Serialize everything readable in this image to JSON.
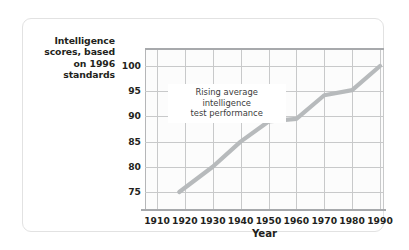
{
  "chart_data": {
    "type": "line",
    "title": "",
    "xlabel": "Year",
    "ylabel": "Intelligence scores, based on 1996 standards",
    "xlim": [
      1910,
      1995
    ],
    "ylim": [
      72,
      103
    ],
    "grid": true,
    "legend": "none",
    "xticks": [
      1910,
      1920,
      1930,
      1940,
      1950,
      1960,
      1970,
      1980,
      1990
    ],
    "yticks": [
      75,
      80,
      85,
      90,
      95,
      100
    ],
    "annotations": [
      {
        "text": "Rising average intelligence test performance",
        "line1": "Rising average intelligence",
        "line2": "test performance",
        "x": 1935,
        "y": 96
      }
    ],
    "series": [
      {
        "name": "Intelligence scores",
        "color": "#b7babc",
        "x": [
          1918,
          1930,
          1940,
          1950,
          1960,
          1970,
          1980,
          1990
        ],
        "values": [
          75,
          80,
          85,
          89,
          89.5,
          94.2,
          95.2,
          100
        ]
      }
    ]
  },
  "axes": {
    "y_title_line1": "Intelligence",
    "y_title_line2": "scores, based",
    "y_title_line3": "on 1996",
    "y_title_line4": "standards",
    "x_title": "Year"
  },
  "colors": {
    "series_line": "#b7babc",
    "grid": "#c8c9ca",
    "frame": "#a7a9ac",
    "card_border": "#e2e2e2",
    "text": "#231f20",
    "annotation_text": "#3b3b3b",
    "plot_background": "#fcfcfc"
  }
}
